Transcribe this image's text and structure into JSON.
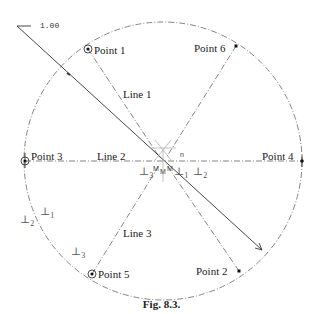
{
  "caption": "Fig. 8.3.",
  "scale_label": "1.00",
  "points": [
    {
      "label": "Point 1",
      "x": 88,
      "y": 49
    },
    {
      "label": "Point 2",
      "x": 239,
      "y": 271
    },
    {
      "label": "Point 3",
      "x": 25,
      "y": 161
    },
    {
      "label": "Point 4",
      "x": 302,
      "y": 161
    },
    {
      "label": "Point 5",
      "x": 92,
      "y": 274
    },
    {
      "label": "Point 6",
      "x": 236,
      "y": 46
    }
  ],
  "lines": [
    {
      "label": "Line 1"
    },
    {
      "label": "Line 2"
    },
    {
      "label": "Line 3"
    }
  ],
  "perpendicular_marks": [
    {
      "symbol": "⊥",
      "sub": "1"
    },
    {
      "symbol": "⊥",
      "sub": "2"
    },
    {
      "symbol": "⊥",
      "sub": "3"
    },
    {
      "symbol": "⊥",
      "sub": "1"
    },
    {
      "symbol": "⊥",
      "sub": "2"
    },
    {
      "symbol": "⊥",
      "sub": "3"
    }
  ],
  "center_marks": [
    "M",
    "M",
    "M",
    "n"
  ],
  "colors": {
    "stroke": "#333333",
    "construction": "#777777",
    "background": "#ffffff"
  }
}
